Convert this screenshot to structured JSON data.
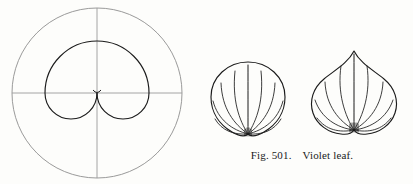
{
  "figure": {
    "caption_number": "Fig. 501.",
    "caption_title": "Violet leaf.",
    "plate_subject": "violet-leaf-geometric-construction"
  },
  "colors": {
    "page_background": "#fdfdfb",
    "guide_stroke": "#8f8f8f",
    "axis_stroke": "#9a9a9a",
    "ink_stroke": "#1b1b1b",
    "caption_text": "#1b1b1b"
  },
  "construction": {
    "name": "geometric-construction-diagram",
    "guide_circle": {
      "label": "guide-circle",
      "cx": 97,
      "cy": 93,
      "r": 85
    },
    "vertical_axis": {
      "label": "vertical-axis",
      "x": 97,
      "y1": 8,
      "y2": 178
    },
    "horizontal_axis": {
      "label": "horizontal-axis",
      "y": 93,
      "x1": 12,
      "x2": 182
    },
    "upper_circle": {
      "label": "upper-arc-circle",
      "cx": 97,
      "cy": 60,
      "r": 52
    },
    "left_lobe": {
      "label": "left-lower-lobe",
      "cx": 71,
      "cy": 93,
      "r": 26
    },
    "right_lobe": {
      "label": "right-lower-lobe",
      "cx": 123,
      "cy": 93,
      "r": 26
    }
  },
  "leaf_rounded": {
    "name": "violet-leaf-rounded",
    "apex": "rounded",
    "vein_count": 9,
    "width": 78,
    "height": 82
  },
  "leaf_pointed": {
    "name": "violet-leaf-pointed",
    "apex": "acuminate",
    "vein_count": 9,
    "width": 92,
    "height": 92
  }
}
